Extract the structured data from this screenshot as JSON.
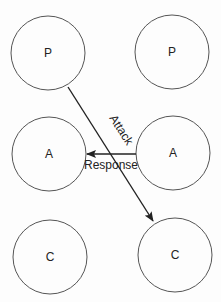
{
  "diagram": {
    "nodes": [
      {
        "id": "p-left",
        "label": "P",
        "cx": 48,
        "cy": 53,
        "r": 37
      },
      {
        "id": "p-right",
        "label": "P",
        "cx": 172,
        "cy": 52,
        "r": 37
      },
      {
        "id": "a-left",
        "label": "A",
        "cx": 49,
        "cy": 154,
        "r": 37
      },
      {
        "id": "a-right",
        "label": "A",
        "cx": 173,
        "cy": 153,
        "r": 37
      },
      {
        "id": "c-left",
        "label": "C",
        "cx": 50,
        "cy": 257,
        "r": 37
      },
      {
        "id": "c-right",
        "label": "C",
        "cx": 175,
        "cy": 255,
        "r": 37
      }
    ],
    "edges": [
      {
        "id": "attack",
        "label": "Attack",
        "from": "p-left",
        "to": "c-right"
      },
      {
        "id": "response",
        "label": "Response",
        "from": "a-right",
        "to": "a-left"
      }
    ],
    "colors": {
      "stroke": "#555555",
      "arrow": "#222222",
      "text": "#222222",
      "background": "#fdfdfd"
    }
  }
}
